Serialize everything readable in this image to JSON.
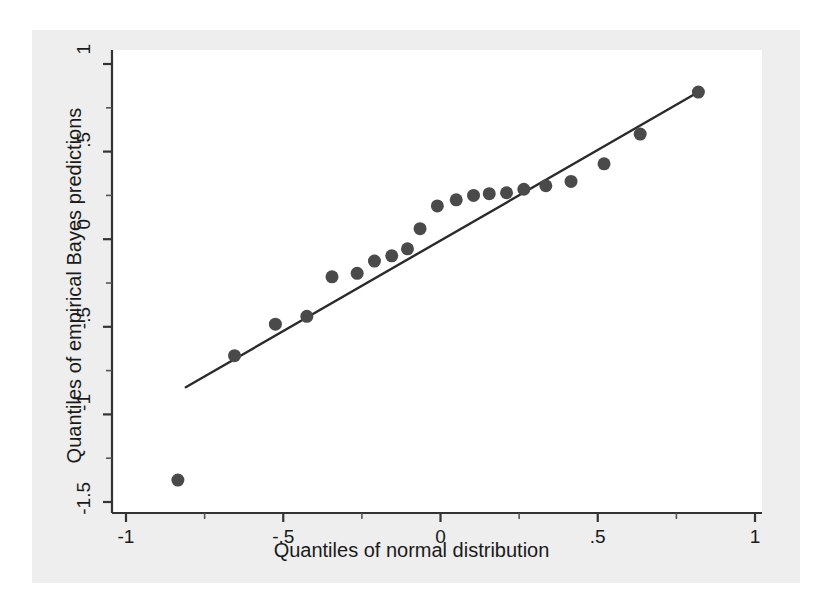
{
  "chart_data": {
    "type": "scatter",
    "title": "",
    "xlabel": "Quantiles of normal distribution",
    "ylabel": "Quantiles of empirical Bayes predictions",
    "xlim": [
      -1,
      1
    ],
    "ylim": [
      -1.5,
      1
    ],
    "grid": false,
    "legend": null,
    "xticks": [
      -1,
      -0.5,
      0,
      0.5,
      1
    ],
    "xtick_labels": [
      "-1",
      "-.5",
      "0",
      ".5",
      "1"
    ],
    "yticks": [
      1,
      0.5,
      0,
      -0.5,
      -1,
      -1.5
    ],
    "ytick_labels": [
      "1",
      ".5",
      "0",
      "-.5",
      "-1",
      "-1.5"
    ],
    "x_minor_ticks": [
      -0.75,
      -0.25,
      0.25,
      0.75
    ],
    "y_minor_ticks": [
      0.75,
      0.25,
      -0.25,
      -0.75,
      -1.25
    ],
    "marker_color": "#4a4a4a",
    "marker_size": 13,
    "line_color": "#2b2b2b",
    "series": [
      {
        "name": "empirical Bayes predictions",
        "x": [
          -0.835,
          -0.655,
          -0.525,
          -0.425,
          -0.345,
          -0.265,
          -0.21,
          -0.155,
          -0.105,
          -0.065,
          -0.01,
          0.05,
          0.105,
          0.155,
          0.21,
          0.265,
          0.335,
          0.415,
          0.52,
          0.635,
          0.82
        ],
        "y": [
          -1.375,
          -0.665,
          -0.485,
          -0.44,
          -0.215,
          -0.195,
          -0.125,
          -0.095,
          -0.055,
          0.06,
          0.19,
          0.225,
          0.25,
          0.26,
          0.265,
          0.285,
          0.305,
          0.33,
          0.43,
          0.6,
          0.84
        ]
      }
    ],
    "reference_line": {
      "name": "45-degree reference line",
      "x0": -0.81,
      "y0": -0.845,
      "x1": 0.82,
      "y1": 0.84
    }
  },
  "axes": {
    "x_title": "Quantiles of normal distribution",
    "y_title": "Quantiles of empirical Bayes predictions"
  }
}
